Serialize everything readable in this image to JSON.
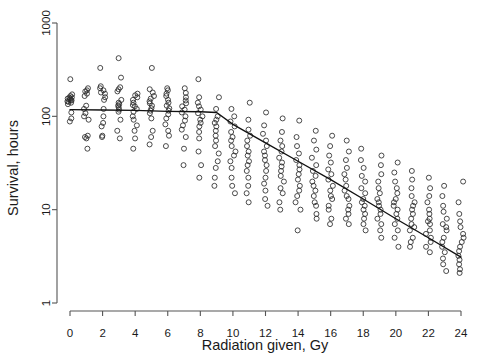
{
  "chart_data": {
    "type": "scatter",
    "title": "",
    "subtitle": "",
    "xlabel": "Radiation given, Gy",
    "ylabel": "Survival, hours",
    "grid": false,
    "legend": null,
    "xscale": "linear",
    "yscale": "log",
    "xlim": [
      0,
      24
    ],
    "ylim": [
      1,
      1000
    ],
    "xticks": [
      0,
      2,
      4,
      6,
      8,
      10,
      12,
      14,
      16,
      18,
      20,
      22,
      24
    ],
    "xtick_labels": [
      "0",
      "2",
      "4",
      "6",
      "8",
      "10",
      "12",
      "14",
      "16",
      "18",
      "20",
      "22",
      "24"
    ],
    "yticks": [
      1,
      10,
      100,
      1000
    ],
    "ytick_labels": [
      "1",
      "10",
      "100",
      "1000"
    ],
    "marker": "open-circle",
    "marker_color": "#2b2b2b",
    "point_columns": [
      {
        "x": 0,
        "y": [
          150,
          148,
          160,
          172,
          155,
          143,
          140,
          152,
          158,
          250,
          165,
          110,
          95,
          88,
          135,
          145
        ]
      },
      {
        "x": 1,
        "y": [
          200,
          185,
          190,
          130,
          120,
          108,
          100,
          92,
          60,
          62,
          58,
          45,
          165,
          175
        ]
      },
      {
        "x": 2,
        "y": [
          330,
          210,
          200,
          180,
          175,
          160,
          150,
          120,
          100,
          85,
          78,
          62,
          60,
          190
        ]
      },
      {
        "x": 3,
        "y": [
          420,
          260,
          205,
          195,
          185,
          150,
          140,
          135,
          130,
          125,
          118,
          112,
          92,
          70,
          58
        ]
      },
      {
        "x": 4,
        "y": [
          175,
          168,
          160,
          150,
          140,
          132,
          128,
          120,
          112,
          100,
          92,
          80,
          70,
          58,
          45
        ]
      },
      {
        "x": 5,
        "y": [
          330,
          195,
          180,
          165,
          155,
          145,
          138,
          130,
          122,
          115,
          108,
          95,
          70,
          60,
          50
        ]
      },
      {
        "x": 6,
        "y": [
          200,
          190,
          175,
          165,
          150,
          140,
          130,
          122,
          115,
          105,
          95,
          82,
          70,
          62,
          48
        ]
      },
      {
        "x": 7,
        "y": [
          200,
          178,
          160,
          148,
          138,
          128,
          118,
          110,
          100,
          90,
          80,
          72,
          60,
          45,
          30
        ]
      },
      {
        "x": 8,
        "y": [
          250,
          160,
          140,
          128,
          118,
          108,
          100,
          92,
          85,
          78,
          68,
          58,
          42,
          30,
          22
        ]
      },
      {
        "x": 9,
        "y": [
          160,
          120,
          100,
          92,
          85,
          78,
          70,
          62,
          55,
          48,
          40,
          33,
          28,
          22,
          18
        ]
      },
      {
        "x": 10,
        "y": [
          120,
          100,
          88,
          78,
          68,
          60,
          55,
          48,
          42,
          38,
          33,
          28,
          22,
          18,
          15
        ]
      },
      {
        "x": 11,
        "y": [
          140,
          92,
          72,
          62,
          55,
          48,
          42,
          38,
          33,
          30,
          26,
          22,
          18,
          15,
          12
        ]
      },
      {
        "x": 12,
        "y": [
          110,
          80,
          65,
          55,
          48,
          42,
          38,
          34,
          30,
          26,
          22,
          19,
          16,
          13,
          11
        ]
      },
      {
        "x": 13,
        "y": [
          95,
          68,
          55,
          48,
          42,
          36,
          32,
          29,
          26,
          23,
          20,
          17,
          15,
          12,
          10
        ]
      },
      {
        "x": 14,
        "y": [
          90,
          60,
          48,
          40,
          34,
          30,
          27,
          24,
          21,
          18,
          16,
          14,
          12,
          10,
          6
        ]
      },
      {
        "x": 15,
        "y": [
          70,
          55,
          44,
          36,
          30,
          26,
          23,
          20,
          18,
          16,
          14,
          12,
          11,
          9,
          8
        ]
      },
      {
        "x": 16,
        "y": [
          62,
          48,
          38,
          32,
          27,
          24,
          21,
          18,
          16,
          14,
          13,
          11,
          10,
          8,
          7
        ]
      },
      {
        "x": 17,
        "y": [
          55,
          42,
          34,
          28,
          24,
          21,
          18,
          16,
          14,
          13,
          11,
          10,
          9,
          8,
          7
        ]
      },
      {
        "x": 18,
        "y": [
          45,
          34,
          28,
          23,
          20,
          17,
          15,
          13,
          12,
          11,
          10,
          9,
          8,
          7,
          6
        ]
      },
      {
        "x": 19,
        "y": [
          38,
          30,
          24,
          20,
          17,
          15,
          13,
          12,
          11,
          10,
          9,
          8,
          7,
          6,
          5
        ]
      },
      {
        "x": 20,
        "y": [
          32,
          25,
          20,
          17,
          15,
          13,
          12,
          11,
          10,
          9,
          8,
          7,
          6,
          5,
          4
        ]
      },
      {
        "x": 21,
        "y": [
          26,
          21,
          17,
          14,
          12,
          11,
          10,
          9,
          8,
          7,
          6.5,
          6,
          5,
          4.5,
          4
        ]
      },
      {
        "x": 22,
        "y": [
          22,
          17,
          14,
          12,
          10,
          9,
          8,
          7.5,
          7,
          6,
          5.5,
          5,
          4.5,
          4,
          3.5
        ]
      },
      {
        "x": 23,
        "y": [
          18,
          14,
          11,
          9.5,
          8,
          7,
          6.5,
          6,
          5,
          4.5,
          4,
          3.5,
          3,
          2.6,
          2.2
        ]
      },
      {
        "x": 24,
        "y": [
          20,
          12,
          9,
          7.5,
          6.5,
          5.5,
          5,
          4.5,
          4,
          3.6,
          3.2,
          2.9,
          2.6,
          2.3,
          2.1
        ]
      }
    ],
    "fit_line": {
      "label": "fitted-regression",
      "points": [
        {
          "x": 0,
          "y": 118
        },
        {
          "x": 2,
          "y": 117
        },
        {
          "x": 4,
          "y": 116
        },
        {
          "x": 6,
          "y": 113
        },
        {
          "x": 8,
          "y": 112
        },
        {
          "x": 9,
          "y": 110
        },
        {
          "x": 10,
          "y": 82
        },
        {
          "x": 12,
          "y": 52
        },
        {
          "x": 14,
          "y": 33
        },
        {
          "x": 16,
          "y": 21
        },
        {
          "x": 18,
          "y": 13
        },
        {
          "x": 20,
          "y": 8
        },
        {
          "x": 22,
          "y": 5
        },
        {
          "x": 24,
          "y": 3.1
        }
      ]
    }
  }
}
